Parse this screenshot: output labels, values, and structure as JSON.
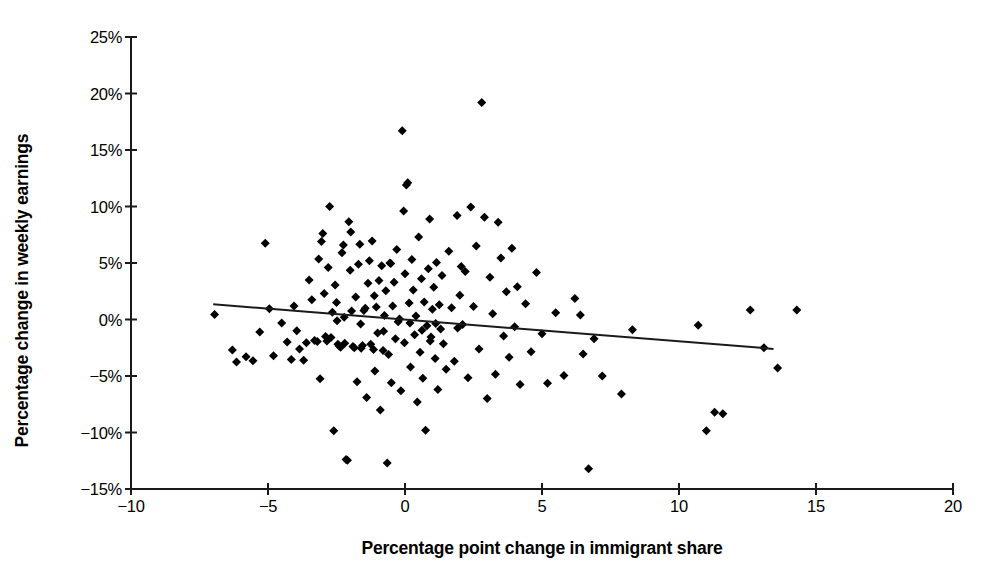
{
  "chart_data": {
    "type": "scatter",
    "title": "",
    "xlabel": "Percentage point change in immigrant share",
    "ylabel": "Percentage change in weekly earnings",
    "xlim": [
      -10,
      20
    ],
    "ylim": [
      -15,
      25
    ],
    "xticks": [
      -10,
      -5,
      0,
      5,
      10,
      15,
      20
    ],
    "xtick_labels": [
      "−10",
      "−5",
      "0",
      "5",
      "10",
      "15",
      "20"
    ],
    "yticks": [
      -15,
      -10,
      -5,
      0,
      5,
      10,
      15,
      20,
      25
    ],
    "ytick_labels": [
      "−15%",
      "−10%",
      "−5%",
      "0%",
      "5%",
      "10%",
      "15%",
      "20%",
      "25%"
    ],
    "grid": false,
    "legend": null,
    "marker": "diamond",
    "marker_color": "#000000",
    "marker_size_px": 9,
    "trendline": {
      "type": "linear",
      "color": "#1a1a1a",
      "width_px": 2,
      "x_start": -7.0,
      "y_start": 1.35,
      "x_end": 13.45,
      "y_end": -2.6
    },
    "points": [
      [
        -6.95,
        0.45
      ],
      [
        -6.3,
        -2.7
      ],
      [
        -6.15,
        -3.75
      ],
      [
        -5.8,
        -3.3
      ],
      [
        -5.55,
        -3.65
      ],
      [
        -5.3,
        -1.1
      ],
      [
        -5.1,
        6.75
      ],
      [
        -4.95,
        0.95
      ],
      [
        -4.8,
        -3.2
      ],
      [
        -4.5,
        -0.3
      ],
      [
        -4.3,
        -2.0
      ],
      [
        -4.15,
        -3.55
      ],
      [
        -3.95,
        -1.0
      ],
      [
        -3.85,
        -2.6
      ],
      [
        -3.7,
        -3.6
      ],
      [
        -3.6,
        -2.05
      ],
      [
        -3.5,
        3.5
      ],
      [
        -3.4,
        1.75
      ],
      [
        -3.3,
        -1.85
      ],
      [
        -3.2,
        -1.95
      ],
      [
        -3.15,
        5.35
      ],
      [
        -3.1,
        -5.25
      ],
      [
        -3.0,
        7.6
      ],
      [
        -2.95,
        2.3
      ],
      [
        -2.9,
        -1.5
      ],
      [
        -2.85,
        -1.9
      ],
      [
        -2.8,
        4.6
      ],
      [
        -2.75,
        10.0
      ],
      [
        -2.7,
        -1.6
      ],
      [
        -2.65,
        0.65
      ],
      [
        -2.6,
        -9.85
      ],
      [
        -2.55,
        3.05
      ],
      [
        -2.5,
        1.5
      ],
      [
        -2.45,
        -2.2
      ],
      [
        -2.4,
        -2.35
      ],
      [
        -2.35,
        -2.45
      ],
      [
        -2.3,
        5.9
      ],
      [
        -2.25,
        6.6
      ],
      [
        -2.2,
        -2.1
      ],
      [
        -2.15,
        -12.4
      ],
      [
        -2.1,
        -12.45
      ],
      [
        -2.05,
        8.65
      ],
      [
        -2.0,
        4.35
      ],
      [
        -1.95,
        0.75
      ],
      [
        -1.9,
        -2.4
      ],
      [
        -1.85,
        -2.5
      ],
      [
        -1.8,
        2.0
      ],
      [
        -1.75,
        -5.5
      ],
      [
        -1.7,
        4.9
      ],
      [
        -1.65,
        6.65
      ],
      [
        -1.6,
        -2.55
      ],
      [
        -1.55,
        -2.3
      ],
      [
        -1.5,
        0.8
      ],
      [
        -1.45,
        1.0
      ],
      [
        -1.4,
        -6.9
      ],
      [
        -1.35,
        3.2
      ],
      [
        -1.3,
        5.2
      ],
      [
        -1.25,
        -2.2
      ],
      [
        -1.2,
        6.95
      ],
      [
        -1.15,
        -2.65
      ],
      [
        -1.1,
        -4.55
      ],
      [
        -1.05,
        1.1
      ],
      [
        -1.0,
        -1.2
      ],
      [
        -0.95,
        3.45
      ],
      [
        -0.9,
        -8.0
      ],
      [
        -0.85,
        4.75
      ],
      [
        -0.8,
        -2.75
      ],
      [
        -0.75,
        0.35
      ],
      [
        -0.7,
        2.55
      ],
      [
        -0.65,
        -12.7
      ],
      [
        -0.6,
        -3.1
      ],
      [
        -0.55,
        5.0
      ],
      [
        -0.5,
        -5.6
      ],
      [
        -0.45,
        1.2
      ],
      [
        -0.4,
        3.3
      ],
      [
        -0.35,
        -1.7
      ],
      [
        -0.3,
        6.2
      ],
      [
        -0.25,
        -0.2
      ],
      [
        -0.2,
        0.05
      ],
      [
        -0.15,
        -6.3
      ],
      [
        -0.1,
        16.7
      ],
      [
        -0.05,
        9.6
      ],
      [
        0.0,
        4.05
      ],
      [
        0.05,
        11.9
      ],
      [
        0.1,
        12.1
      ],
      [
        0.15,
        1.45
      ],
      [
        0.2,
        -4.2
      ],
      [
        0.25,
        5.3
      ],
      [
        0.3,
        2.6
      ],
      [
        0.35,
        -1.35
      ],
      [
        0.4,
        0.3
      ],
      [
        0.45,
        -7.3
      ],
      [
        0.5,
        7.3
      ],
      [
        0.55,
        -2.9
      ],
      [
        0.6,
        3.6
      ],
      [
        0.65,
        -5.2
      ],
      [
        0.7,
        1.55
      ],
      [
        0.75,
        -9.8
      ],
      [
        0.8,
        -0.55
      ],
      [
        0.85,
        4.5
      ],
      [
        0.9,
        8.9
      ],
      [
        0.95,
        -1.55
      ],
      [
        1.0,
        0.9
      ],
      [
        1.05,
        2.85
      ],
      [
        1.1,
        -3.45
      ],
      [
        1.15,
        5.05
      ],
      [
        1.2,
        -6.2
      ],
      [
        1.25,
        1.3
      ],
      [
        1.3,
        -0.85
      ],
      [
        1.35,
        3.9
      ],
      [
        1.4,
        -2.15
      ],
      [
        1.5,
        -4.4
      ],
      [
        1.6,
        6.05
      ],
      [
        1.7,
        1.05
      ],
      [
        1.8,
        -3.7
      ],
      [
        1.9,
        9.2
      ],
      [
        2.0,
        2.15
      ],
      [
        2.1,
        -0.45
      ],
      [
        2.2,
        4.25
      ],
      [
        2.3,
        -5.15
      ],
      [
        2.4,
        9.95
      ],
      [
        2.5,
        1.15
      ],
      [
        2.6,
        6.5
      ],
      [
        2.7,
        -2.6
      ],
      [
        2.8,
        19.2
      ],
      [
        2.9,
        9.05
      ],
      [
        3.0,
        -7.0
      ],
      [
        3.1,
        3.75
      ],
      [
        3.2,
        0.5
      ],
      [
        3.3,
        -4.85
      ],
      [
        3.4,
        8.6
      ],
      [
        3.5,
        5.45
      ],
      [
        3.6,
        -1.45
      ],
      [
        3.7,
        2.45
      ],
      [
        3.8,
        -3.35
      ],
      [
        3.9,
        6.3
      ],
      [
        4.0,
        -0.65
      ],
      [
        4.1,
        2.9
      ],
      [
        4.2,
        -5.75
      ],
      [
        4.4,
        1.4
      ],
      [
        4.6,
        -2.85
      ],
      [
        4.8,
        4.15
      ],
      [
        5.0,
        -1.25
      ],
      [
        5.2,
        -5.65
      ],
      [
        5.5,
        0.6
      ],
      [
        5.8,
        -4.95
      ],
      [
        6.2,
        1.85
      ],
      [
        6.4,
        0.4
      ],
      [
        6.5,
        -3.05
      ],
      [
        6.7,
        -13.2
      ],
      [
        6.9,
        -1.7
      ],
      [
        7.2,
        -5.0
      ],
      [
        7.9,
        -6.6
      ],
      [
        8.3,
        -0.9
      ],
      [
        10.7,
        -0.5
      ],
      [
        11.0,
        -9.85
      ],
      [
        11.3,
        -8.2
      ],
      [
        11.6,
        -8.35
      ],
      [
        12.6,
        0.85
      ],
      [
        13.1,
        -2.5
      ],
      [
        13.6,
        -4.3
      ],
      [
        14.3,
        0.85
      ],
      [
        -3.05,
        6.9
      ],
      [
        -2.48,
        -0.1
      ],
      [
        -1.98,
        7.75
      ],
      [
        -1.62,
        -0.4
      ],
      [
        -0.52,
        4.95
      ],
      [
        0.18,
        -0.3
      ],
      [
        0.62,
        -0.95
      ],
      [
        1.12,
        -0.35
      ],
      [
        -4.05,
        1.2
      ],
      [
        -2.22,
        0.2
      ],
      [
        -0.78,
        -1.05
      ],
      [
        2.05,
        4.7
      ],
      [
        -1.12,
        2.1
      ],
      [
        -0.02,
        -2.05
      ],
      [
        0.92,
        -1.9
      ],
      [
        1.92,
        -0.75
      ]
    ]
  }
}
